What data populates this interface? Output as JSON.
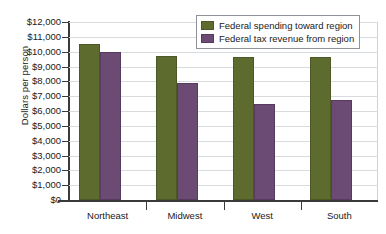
{
  "chart_data": {
    "type": "bar",
    "title": "",
    "xlabel": "",
    "ylabel": "Dollars per person",
    "ylim": [
      0,
      12000
    ],
    "ytick_step": 1000,
    "grid": true,
    "legend_position": "top-right",
    "categories": [
      "Northeast",
      "Midwest",
      "West",
      "South"
    ],
    "series": [
      {
        "name": "Federal spending toward region",
        "color": "#5d6b2f",
        "values": [
          10550,
          9700,
          9670,
          9660
        ]
      },
      {
        "name": "Federal tax revenue from region",
        "color": "#6b4a73",
        "values": [
          9950,
          7880,
          6450,
          6740
        ]
      }
    ],
    "ytick_labels": [
      "$0",
      "$1,000",
      "$2,000",
      "$3,000",
      "$4,000",
      "$5,000",
      "$6,000",
      "$7,000",
      "$8,000",
      "$9,000",
      "$10,000",
      "$11,000",
      "$12,000"
    ]
  },
  "colors": {
    "spending": "#5d6b2f",
    "revenue": "#6b4a73",
    "axis": "#3a3a3a",
    "grid": "#d8dcdf",
    "background": "#ffffff"
  }
}
